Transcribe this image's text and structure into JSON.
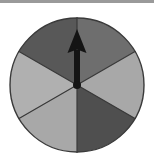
{
  "figure": {
    "name": "spinner-wheel",
    "background_color": "#ffffff",
    "top_border_color": "#9a9a9a"
  },
  "chart_data": {
    "type": "pie",
    "title": "",
    "subtitle": "",
    "xlabel": "",
    "ylabel": "",
    "grid": false,
    "legend_position": "none",
    "equal_sectors": true,
    "sector_count": 6,
    "sector_angle_degrees": 60,
    "categories": [
      "sector-1-upper-right",
      "sector-2-right",
      "sector-3-lower-right",
      "sector-4-lower-left",
      "sector-5-left",
      "sector-6-upper-left"
    ],
    "values": [
      60,
      60,
      60,
      60,
      60,
      60
    ],
    "colors": [
      "#6e6e6e",
      "#a8a8a8",
      "#4f4f4f",
      "#a8a8a8",
      "#b0b0b0",
      "#585858"
    ],
    "labels": [
      "",
      "",
      "",
      "",
      "",
      ""
    ],
    "annotations": [
      {
        "name": "pointer-arrow",
        "type": "arrow",
        "direction": "up",
        "angle_degrees": 90,
        "color": "#141414"
      }
    ]
  },
  "geometry": {
    "circle": {
      "center_x": 77,
      "center_y": 85,
      "radius": 67,
      "outline_color": "#3a3a3a",
      "outline_width": 1.2
    },
    "divider": {
      "color": "#3a3a3a",
      "width": 1.2,
      "angles_degrees": [
        90,
        30,
        330,
        270,
        210,
        150
      ]
    },
    "arrow": {
      "tail_x": 77,
      "tail_y": 85,
      "tip_x": 77,
      "tip_y": 29,
      "shaft_width": 6,
      "head_width": 19,
      "head_length": 24,
      "pivot_radius": 4,
      "color": "#141414"
    }
  }
}
